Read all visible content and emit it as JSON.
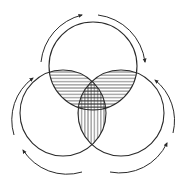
{
  "diagram": {
    "type": "venn-three-circles-with-cycle-arrows",
    "stroke_color": "#2a2a2a",
    "background": "#ffffff",
    "circles": [
      {
        "name": "top",
        "cx": 93,
        "cy": 66,
        "r": 44
      },
      {
        "name": "bottom-left",
        "cx": 63,
        "cy": 113,
        "r": 43
      },
      {
        "name": "bottom-right",
        "cx": 121,
        "cy": 113,
        "r": 43
      }
    ],
    "hatching": {
      "top_pairwise_lenses": "horizontal",
      "bottom_lens": "vertical",
      "center_triple": "crosshatch"
    },
    "arrows": [
      {
        "name": "top-left-arc",
        "direction": "clockwise"
      },
      {
        "name": "top-right-arc",
        "direction": "clockwise"
      },
      {
        "name": "right-upper-arc",
        "direction": "counterclockwise"
      },
      {
        "name": "right-lower-arc",
        "direction": "counterclockwise"
      },
      {
        "name": "left-upper-arc",
        "direction": "clockwise"
      },
      {
        "name": "left-lower-arc",
        "direction": "clockwise"
      }
    ]
  }
}
